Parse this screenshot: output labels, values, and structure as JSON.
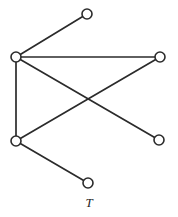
{
  "figure": {
    "label": "T",
    "background_color": "#ffffff",
    "stroke_color": "#2b2b2b",
    "vertex_fill_color": "#ffffff",
    "vertex_radius": 5,
    "edge_width": 1.7
  },
  "chart_data": {
    "type": "diagram",
    "title": "T",
    "diagram_kind": "undirected graph",
    "vertex_count": 6,
    "edge_count": 6,
    "nodes": [
      {
        "id": "v1",
        "label": "",
        "x": 87,
        "y": 14
      },
      {
        "id": "v2",
        "label": "",
        "x": 16,
        "y": 57
      },
      {
        "id": "v3",
        "label": "",
        "x": 160,
        "y": 57
      },
      {
        "id": "v4",
        "label": "",
        "x": 159,
        "y": 140
      },
      {
        "id": "v5",
        "label": "",
        "x": 16,
        "y": 141
      },
      {
        "id": "v6",
        "label": "",
        "x": 88,
        "y": 183
      }
    ],
    "edges": [
      {
        "from": "v2",
        "to": "v1"
      },
      {
        "from": "v2",
        "to": "v3"
      },
      {
        "from": "v2",
        "to": "v4"
      },
      {
        "from": "v2",
        "to": "v5"
      },
      {
        "from": "v5",
        "to": "v3"
      },
      {
        "from": "v5",
        "to": "v6"
      }
    ]
  }
}
